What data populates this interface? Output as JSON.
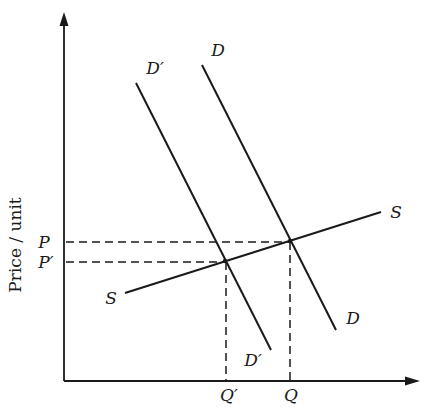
{
  "diagram": {
    "type": "supply-demand",
    "axes": {
      "y_label": "Price / unit",
      "x_label": "",
      "y_ticks": [
        {
          "label": "P",
          "y": 242
        },
        {
          "label": "P'",
          "y": 262
        }
      ],
      "x_ticks": [
        {
          "label": "Q'",
          "x": 226
        },
        {
          "label": "Q",
          "x": 290
        }
      ]
    },
    "curves": [
      {
        "name": "S",
        "start_label": "S",
        "end_label": "S"
      },
      {
        "name": "D",
        "start_label": "D",
        "end_label": "D"
      },
      {
        "name": "D'",
        "start_label": "D'",
        "end_label": "D'"
      }
    ],
    "equilibria": [
      {
        "name": "E",
        "curves": [
          "D",
          "S"
        ],
        "price": "P",
        "quantity": "Q"
      },
      {
        "name": "E'",
        "curves": [
          "D'",
          "S"
        ],
        "price": "P'",
        "quantity": "Q'"
      }
    ],
    "colors": {
      "ink": "#1a1a1a",
      "background": "#ffffff"
    }
  },
  "labels": {
    "y_axis": "Price / unit",
    "p": "P",
    "p_prime": "P′",
    "q": "Q",
    "q_prime": "Q′",
    "s_left": "S",
    "s_right": "S",
    "d_top": "D",
    "d_bottom": "D",
    "dprime_top": "D′",
    "dprime_bottom": "D′"
  }
}
